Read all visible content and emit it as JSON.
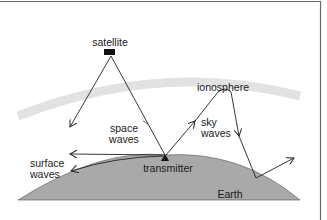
{
  "diagram": {
    "labels": {
      "satellite": "satellite",
      "ionosphere": "ionosphere",
      "space_waves_1": "space",
      "space_waves_2": "waves",
      "sky_waves_1": "sky",
      "sky_waves_2": "waves",
      "surface_waves_1": "surface",
      "surface_waves_2": "waves",
      "transmitter": "transmitter",
      "earth": "Earth"
    },
    "colors": {
      "earth_fill": "#a9a9a9",
      "ionosphere_band": "#e2e2e2",
      "lines": "#222222",
      "frame": "#666666"
    }
  }
}
